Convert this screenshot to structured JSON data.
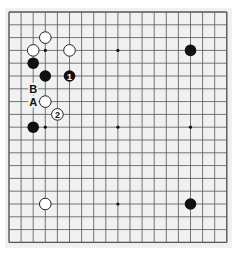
{
  "diagram": {
    "type": "go-board",
    "size": 19,
    "origin": {
      "x": 9,
      "y": 12
    },
    "spacing": {
      "x": 12.1,
      "y": 12.8
    },
    "star_points": [
      [
        3,
        3
      ],
      [
        9,
        3
      ],
      [
        15,
        3
      ],
      [
        3,
        9
      ],
      [
        9,
        9
      ],
      [
        15,
        9
      ],
      [
        3,
        15
      ],
      [
        9,
        15
      ],
      [
        15,
        15
      ]
    ],
    "colors": {
      "line": "#555555",
      "black": "#111111",
      "white": "#ffffff",
      "board": "#f1f1f1"
    },
    "stones": [
      {
        "color": "white",
        "col": 3,
        "row": 2,
        "label": ""
      },
      {
        "color": "white",
        "col": 2,
        "row": 3,
        "label": ""
      },
      {
        "color": "white",
        "col": 5,
        "row": 3,
        "label": ""
      },
      {
        "color": "black",
        "col": 2,
        "row": 4,
        "label": ""
      },
      {
        "color": "black",
        "col": 3,
        "row": 5,
        "label": ""
      },
      {
        "color": "black",
        "col": 5,
        "row": 5,
        "label": "1"
      },
      {
        "color": "white",
        "col": 3,
        "row": 7,
        "label": ""
      },
      {
        "color": "white",
        "col": 4,
        "row": 8,
        "label": "2"
      },
      {
        "color": "black",
        "col": 2,
        "row": 9,
        "label": ""
      },
      {
        "color": "black",
        "col": 15,
        "row": 3,
        "label": ""
      },
      {
        "color": "white",
        "col": 3,
        "row": 15,
        "label": ""
      },
      {
        "color": "black",
        "col": 15,
        "row": 15,
        "label": ""
      }
    ],
    "markers": [
      {
        "col": 2,
        "row": 6,
        "label": "B"
      },
      {
        "col": 2,
        "row": 7,
        "label": "A"
      }
    ]
  }
}
